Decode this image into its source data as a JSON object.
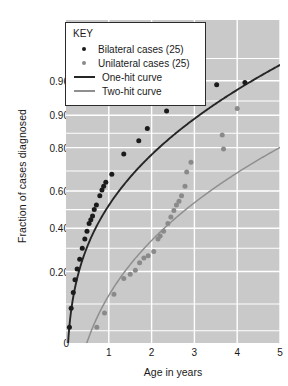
{
  "chart_data": {
    "type": "scatter",
    "title": "",
    "xlabel": "Age in years",
    "ylabel": "Fraction of cases diagnosed",
    "xlim": [
      0,
      5
    ],
    "xticks": [
      1,
      2,
      3,
      4,
      5
    ],
    "xticklabels": [
      "1",
      "2",
      "3",
      "4",
      "5"
    ],
    "yticks": [
      0,
      0.2,
      0.4,
      0.6,
      0.8,
      0.9,
      0.96,
      1.0
    ],
    "yticklabels": [
      "0",
      "0.20",
      "0.40",
      "0.60",
      "0.80",
      "0.90",
      "0.96",
      "1.00"
    ],
    "y_scale": "probability (cumulative-normal / logit-like)",
    "grid": true,
    "legend_position": "top-left",
    "plot_background": "#c9c9c9",
    "gridline_color": "#ffffff",
    "series": [
      {
        "name": "Bilateral cases (25)",
        "type": "scatter",
        "color": "#1b1b1b",
        "count": 25,
        "points": [
          [
            0.08,
            0.055
          ],
          [
            0.12,
            0.09
          ],
          [
            0.17,
            0.13
          ],
          [
            0.21,
            0.17
          ],
          [
            0.26,
            0.21
          ],
          [
            0.32,
            0.25
          ],
          [
            0.38,
            0.3
          ],
          [
            0.44,
            0.345
          ],
          [
            0.49,
            0.385
          ],
          [
            0.54,
            0.425
          ],
          [
            0.58,
            0.445
          ],
          [
            0.62,
            0.465
          ],
          [
            0.66,
            0.5
          ],
          [
            0.71,
            0.525
          ],
          [
            0.79,
            0.575
          ],
          [
            0.84,
            0.605
          ],
          [
            0.88,
            0.625
          ],
          [
            0.93,
            0.645
          ],
          [
            1.07,
            0.685
          ],
          [
            1.35,
            0.775
          ],
          [
            1.7,
            0.825
          ],
          [
            1.9,
            0.865
          ],
          [
            2.35,
            0.91
          ],
          [
            3.52,
            0.955
          ],
          [
            4.18,
            0.958
          ]
        ]
      },
      {
        "name": "Unilateral cases (25)",
        "type": "scatter",
        "color": "#8a8a8a",
        "count": 25,
        "points": [
          [
            0.72,
            0.055
          ],
          [
            0.9,
            0.08
          ],
          [
            1.12,
            0.125
          ],
          [
            1.35,
            0.175
          ],
          [
            1.5,
            0.19
          ],
          [
            1.62,
            0.205
          ],
          [
            1.72,
            0.235
          ],
          [
            1.82,
            0.255
          ],
          [
            1.92,
            0.265
          ],
          [
            2.05,
            0.285
          ],
          [
            2.15,
            0.345
          ],
          [
            2.2,
            0.36
          ],
          [
            2.28,
            0.385
          ],
          [
            2.38,
            0.425
          ],
          [
            2.45,
            0.46
          ],
          [
            2.52,
            0.495
          ],
          [
            2.58,
            0.525
          ],
          [
            2.64,
            0.545
          ],
          [
            2.7,
            0.575
          ],
          [
            2.78,
            0.625
          ],
          [
            2.82,
            0.695
          ],
          [
            2.92,
            0.74
          ],
          [
            3.65,
            0.845
          ],
          [
            3.68,
            0.795
          ],
          [
            4.0,
            0.915
          ]
        ]
      },
      {
        "name": "One-hit curve",
        "type": "line",
        "color": "#262626",
        "description": "Single-event (dominant, bilateral) cumulative distribution"
      },
      {
        "name": "Two-hit curve",
        "type": "line",
        "color": "#8f8f8f",
        "description": "Two-event (sporadic, unilateral) cumulative distribution"
      }
    ]
  },
  "legend": {
    "title": "KEY",
    "items": [
      {
        "label": "Bilateral cases (25)",
        "marker": "dot-dark",
        "icon": "filled-circle-dark-icon"
      },
      {
        "label": "Unilateral cases (25)",
        "marker": "dot-gray",
        "icon": "filled-circle-gray-icon"
      },
      {
        "label": "One-hit curve",
        "marker": "line-dark",
        "icon": "line-segment-dark-icon"
      },
      {
        "label": "Two-hit curve",
        "marker": "line-gray",
        "icon": "line-segment-gray-icon"
      }
    ]
  },
  "axes": {
    "y_label": "Fraction of cases diagnosed",
    "x_label": "Age in years",
    "y_ticks": [
      {
        "label": "1.00",
        "value": 1.0
      },
      {
        "label": "0.96",
        "value": 0.96
      },
      {
        "label": "0.90",
        "value": 0.9
      },
      {
        "label": "0.80",
        "value": 0.8
      },
      {
        "label": "0.60",
        "value": 0.6
      },
      {
        "label": "0.40",
        "value": 0.4
      },
      {
        "label": "0.20",
        "value": 0.2
      },
      {
        "label": "0",
        "value": 0.0
      }
    ],
    "x_ticks": [
      {
        "label": "1",
        "value": 1
      },
      {
        "label": "2",
        "value": 2
      },
      {
        "label": "3",
        "value": 3
      },
      {
        "label": "4",
        "value": 4
      },
      {
        "label": "5",
        "value": 5
      }
    ]
  },
  "colors": {
    "plot_bg": "#c9c9c9",
    "grid": "#ffffff",
    "dark_series": "#1b1b1b",
    "gray_series": "#8a8a8a",
    "text": "#1a1a1a"
  }
}
